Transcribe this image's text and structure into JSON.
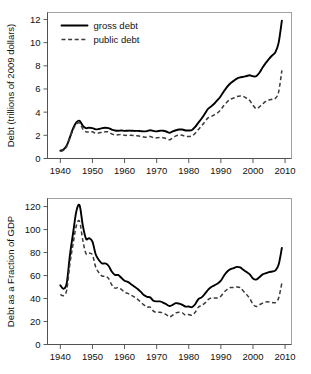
{
  "figure": {
    "title": "",
    "background_color": "#ffffff",
    "line_color": "#000000"
  },
  "chart_data": [
    {
      "type": "line",
      "panel": "top",
      "title": "",
      "xlabel": "",
      "ylabel": "Debt (trillions of 2009 dollars)",
      "xlim": [
        1936,
        2012
      ],
      "ylim": [
        0,
        12.6
      ],
      "xticks": [
        1940,
        1950,
        1960,
        1970,
        1980,
        1990,
        2000,
        2010
      ],
      "yticks": [
        0,
        2,
        4,
        6,
        8,
        10,
        12
      ],
      "xticklabels": [
        "1940",
        "1950",
        "1960",
        "1970",
        "1980",
        "1990",
        "2000",
        "2010"
      ],
      "yticklabels": [
        "0",
        "2",
        "4",
        "6",
        "8",
        "10",
        "12"
      ],
      "grid": false,
      "legend_position": "upper left",
      "x": [
        1940,
        1941,
        1942,
        1943,
        1944,
        1945,
        1946,
        1947,
        1948,
        1949,
        1950,
        1951,
        1952,
        1953,
        1954,
        1955,
        1956,
        1957,
        1958,
        1959,
        1960,
        1961,
        1962,
        1963,
        1964,
        1965,
        1966,
        1967,
        1968,
        1969,
        1970,
        1971,
        1972,
        1973,
        1974,
        1975,
        1976,
        1977,
        1978,
        1979,
        1980,
        1981,
        1982,
        1983,
        1984,
        1985,
        1986,
        1987,
        1988,
        1989,
        1990,
        1991,
        1992,
        1993,
        1994,
        1995,
        1996,
        1997,
        1998,
        1999,
        2000,
        2001,
        2002,
        2003,
        2004,
        2005,
        2006,
        2007,
        2008,
        2009
      ],
      "series": [
        {
          "name": "gross debt",
          "style": "solid",
          "values": [
            0.68,
            0.78,
            1.12,
            1.85,
            2.62,
            3.12,
            3.25,
            2.82,
            2.62,
            2.66,
            2.62,
            2.52,
            2.55,
            2.62,
            2.65,
            2.62,
            2.5,
            2.42,
            2.4,
            2.42,
            2.38,
            2.4,
            2.4,
            2.38,
            2.38,
            2.36,
            2.34,
            2.36,
            2.44,
            2.38,
            2.34,
            2.4,
            2.4,
            2.33,
            2.22,
            2.34,
            2.44,
            2.5,
            2.5,
            2.42,
            2.42,
            2.46,
            2.72,
            3.1,
            3.45,
            3.86,
            4.28,
            4.5,
            4.75,
            5.05,
            5.4,
            5.82,
            6.2,
            6.5,
            6.7,
            6.9,
            7.0,
            7.05,
            7.12,
            7.18,
            7.1,
            7.1,
            7.4,
            7.85,
            8.25,
            8.6,
            8.9,
            9.18,
            10.0,
            11.9
          ]
        },
        {
          "name": "public debt",
          "style": "dashed",
          "values": [
            0.62,
            0.72,
            1.05,
            1.78,
            2.5,
            2.98,
            3.05,
            2.55,
            2.3,
            2.3,
            2.3,
            2.18,
            2.2,
            2.28,
            2.3,
            2.3,
            2.12,
            2.04,
            2.04,
            2.08,
            2.0,
            2.0,
            2.0,
            1.98,
            1.96,
            1.92,
            1.86,
            1.84,
            1.9,
            1.8,
            1.78,
            1.82,
            1.8,
            1.72,
            1.62,
            1.78,
            1.95,
            2.02,
            2.0,
            1.9,
            1.9,
            1.95,
            2.18,
            2.5,
            2.82,
            3.16,
            3.5,
            3.62,
            3.78,
            3.95,
            4.22,
            4.6,
            4.9,
            5.12,
            5.22,
            5.35,
            5.4,
            5.35,
            5.2,
            5.0,
            4.6,
            4.3,
            4.45,
            4.7,
            4.92,
            5.05,
            5.12,
            5.2,
            5.75,
            7.6
          ]
        }
      ],
      "legend": [
        {
          "label": "gross debt",
          "style": "solid"
        },
        {
          "label": "public debt",
          "style": "dashed"
        }
      ]
    },
    {
      "type": "line",
      "panel": "bottom",
      "title": "",
      "xlabel": "",
      "ylabel": "Debt as a Fraction of GDP",
      "xlim": [
        1936,
        2012
      ],
      "ylim": [
        0,
        127
      ],
      "xticks": [
        1940,
        1950,
        1960,
        1970,
        1980,
        1990,
        2000,
        2010
      ],
      "yticks": [
        0,
        20,
        40,
        60,
        80,
        100,
        120
      ],
      "xticklabels": [
        "1940",
        "1950",
        "1960",
        "1970",
        "1980",
        "1990",
        "2000",
        "2010"
      ],
      "yticklabels": [
        "0",
        "20",
        "40",
        "60",
        "80",
        "100",
        "120"
      ],
      "grid": false,
      "legend_position": "none",
      "x": [
        1940,
        1941,
        1942,
        1943,
        1944,
        1945,
        1946,
        1947,
        1948,
        1949,
        1950,
        1951,
        1952,
        1953,
        1954,
        1955,
        1956,
        1957,
        1958,
        1959,
        1960,
        1961,
        1962,
        1963,
        1964,
        1965,
        1966,
        1967,
        1968,
        1969,
        1970,
        1971,
        1972,
        1973,
        1974,
        1975,
        1976,
        1977,
        1978,
        1979,
        1980,
        1981,
        1982,
        1983,
        1984,
        1985,
        1986,
        1987,
        1988,
        1989,
        1990,
        1991,
        1992,
        1993,
        1994,
        1995,
        1996,
        1997,
        1998,
        1999,
        2000,
        2001,
        2002,
        2003,
        2004,
        2005,
        2006,
        2007,
        2008,
        2009
      ],
      "series": [
        {
          "name": "gross debt",
          "style": "solid",
          "values": [
            51.5,
            48.5,
            53.5,
            78.0,
            97.5,
            116.0,
            121.0,
            103.5,
            92.0,
            92.5,
            89.5,
            78.5,
            73.5,
            70.5,
            70.5,
            68.5,
            63.5,
            60.5,
            60.5,
            58.0,
            55.5,
            54.5,
            52.5,
            50.5,
            48.5,
            46.0,
            43.0,
            41.5,
            41.0,
            38.0,
            37.5,
            37.5,
            36.5,
            35.0,
            33.5,
            34.5,
            36.0,
            35.5,
            34.5,
            33.0,
            33.0,
            32.5,
            35.0,
            39.5,
            41.0,
            44.0,
            47.5,
            50.0,
            51.5,
            53.0,
            55.5,
            60.0,
            63.5,
            65.5,
            66.5,
            67.5,
            67.0,
            65.0,
            63.0,
            61.0,
            57.5,
            56.5,
            58.5,
            61.0,
            62.0,
            63.0,
            63.5,
            64.5,
            69.5,
            84.0
          ]
        },
        {
          "name": "public debt",
          "style": "dashed",
          "values": [
            43.5,
            42.5,
            47.5,
            70.5,
            88.0,
            103.5,
            107.0,
            90.5,
            79.0,
            79.5,
            78.0,
            67.5,
            62.5,
            59.5,
            59.5,
            57.5,
            52.0,
            49.0,
            49.5,
            48.0,
            45.5,
            44.5,
            43.0,
            41.5,
            39.5,
            37.0,
            34.5,
            32.5,
            32.5,
            29.0,
            28.0,
            28.0,
            27.5,
            26.0,
            24.0,
            25.5,
            27.5,
            28.0,
            27.5,
            25.5,
            26.0,
            25.5,
            28.0,
            32.5,
            34.0,
            36.0,
            39.0,
            40.5,
            40.5,
            40.5,
            42.0,
            45.5,
            48.0,
            49.5,
            49.5,
            50.0,
            49.5,
            46.5,
            43.5,
            40.0,
            35.0,
            33.0,
            34.5,
            36.0,
            37.0,
            37.0,
            36.5,
            36.5,
            40.5,
            53.5
          ]
        }
      ]
    }
  ]
}
